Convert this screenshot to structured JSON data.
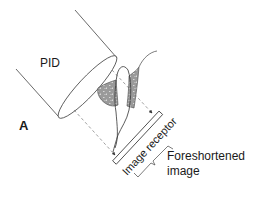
{
  "diagram": {
    "panel_label": "A",
    "labels": {
      "pid": "PID",
      "image_receptor": "Image receptor",
      "foreshortened_line1": "Foreshortened",
      "foreshortened_line2": "image"
    },
    "colors": {
      "line": "#333333",
      "bone_fill": "#9a9a9a",
      "bone_speckle": "#d8d8d8",
      "dashed": "#777777",
      "text": "#1a1a1a",
      "background": "#ffffff"
    }
  }
}
